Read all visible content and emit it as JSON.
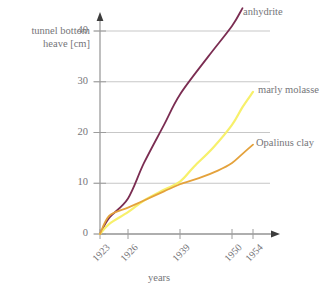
{
  "chart_data": {
    "type": "line",
    "title": "",
    "xlabel": "years",
    "ylabel": "tunnel bottom heave [cm]",
    "ylabel_line1": "tunnel bottom",
    "ylabel_line2": "heave [cm]",
    "ylim": [
      0,
      40
    ],
    "yticks": [
      0,
      10,
      20,
      30,
      40
    ],
    "ytick_labels": [
      "0",
      "10",
      "20",
      "30",
      "40"
    ],
    "xticks": [
      1923,
      1926,
      1939,
      1950,
      1954
    ],
    "xtick_labels": [
      "1923",
      "1926",
      "1939",
      "1950",
      "1954"
    ],
    "grid": "horizontal",
    "legend": "inline-right-of-curve-ends",
    "series": [
      {
        "name": "anhydrite",
        "color": "#7B2D52",
        "label_value": "anhydrite",
        "points": [
          {
            "x": 1923,
            "y": 0
          },
          {
            "x": 1924,
            "y": 3.2
          },
          {
            "x": 1926,
            "y": 7.0
          },
          {
            "x": 1930,
            "y": 14.0
          },
          {
            "x": 1935,
            "y": 21.5
          },
          {
            "x": 1939,
            "y": 27.5
          },
          {
            "x": 1945,
            "y": 35.0
          },
          {
            "x": 1950,
            "y": 41.0
          },
          {
            "x": 1952,
            "y": 44.5
          }
        ]
      },
      {
        "name": "marly molasse",
        "color": "#F7F06B",
        "label_value": "marly molasse",
        "points": [
          {
            "x": 1923,
            "y": 0
          },
          {
            "x": 1924,
            "y": 2.0
          },
          {
            "x": 1926,
            "y": 4.3
          },
          {
            "x": 1930,
            "y": 6.6
          },
          {
            "x": 1935,
            "y": 8.7
          },
          {
            "x": 1939,
            "y": 10.3
          },
          {
            "x": 1942,
            "y": 13.3
          },
          {
            "x": 1946,
            "y": 17.0
          },
          {
            "x": 1950,
            "y": 21.5
          },
          {
            "x": 1952,
            "y": 25.0
          },
          {
            "x": 1954,
            "y": 28.0
          }
        ]
      },
      {
        "name": "Opalinus clay",
        "color": "#E4A23C",
        "label_value": "Opalinus clay",
        "points": [
          {
            "x": 1923,
            "y": 0
          },
          {
            "x": 1924,
            "y": 3.6
          },
          {
            "x": 1926,
            "y": 5.2
          },
          {
            "x": 1930,
            "y": 6.6
          },
          {
            "x": 1935,
            "y": 8.4
          },
          {
            "x": 1939,
            "y": 9.8
          },
          {
            "x": 1943,
            "y": 11.0
          },
          {
            "x": 1947,
            "y": 12.5
          },
          {
            "x": 1950,
            "y": 14.0
          },
          {
            "x": 1952,
            "y": 15.8
          },
          {
            "x": 1954,
            "y": 17.6
          }
        ]
      }
    ],
    "colors": {
      "background": "#FFFFFF",
      "axis": "#9C9C9C",
      "grid": "#B9B9B9",
      "text": "#757579"
    }
  }
}
